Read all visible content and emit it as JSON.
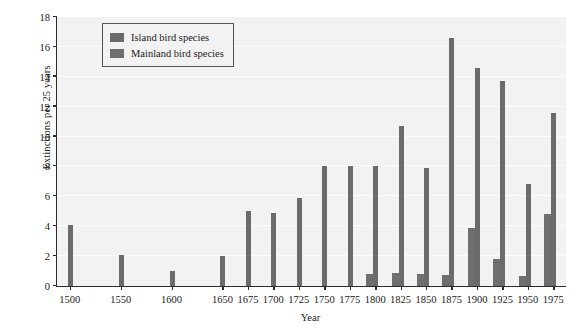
{
  "chart_data": {
    "type": "bar",
    "title": "",
    "xlabel": "Year",
    "ylabel": "Extinctions per 25 years",
    "xlim": [
      1487.5,
      1987.5
    ],
    "ylim": [
      0,
      18
    ],
    "ytick_step": 2,
    "grid": true,
    "legend_position": "top-left-inside",
    "categories": [
      1500,
      1525,
      1550,
      1575,
      1600,
      1625,
      1650,
      1675,
      1700,
      1725,
      1750,
      1775,
      1800,
      1825,
      1850,
      1875,
      1900,
      1925,
      1950,
      1975
    ],
    "xtick_labels": [
      "1500",
      "1550",
      "1600",
      "1650",
      "1675",
      "1700",
      "1725",
      "1750",
      "1775",
      "1800",
      "1825",
      "1850",
      "1875",
      "1900",
      "1925",
      "1950",
      "1975"
    ],
    "xtick_values": [
      1500,
      1550,
      1600,
      1650,
      1675,
      1700,
      1725,
      1750,
      1775,
      1800,
      1825,
      1850,
      1875,
      1900,
      1925,
      1950,
      1975
    ],
    "ytick_labels": [
      "0",
      "2",
      "4",
      "6",
      "8",
      "10",
      "12",
      "14",
      "16",
      "18"
    ],
    "ytick_values": [
      0,
      2,
      4,
      6,
      8,
      10,
      12,
      14,
      16,
      18
    ],
    "series": [
      {
        "name": "Island bird species",
        "color": "#6b6b6b",
        "values": [
          4.1,
          0,
          2.1,
          0,
          1.0,
          0,
          2.0,
          5.0,
          4.9,
          5.9,
          8.0,
          8.0,
          8.0,
          10.7,
          7.9,
          16.6,
          14.6,
          13.7,
          6.8,
          11.6
        ]
      },
      {
        "name": "Mainland bird species",
        "color": "#6f6f6f",
        "values": [
          0,
          0,
          0,
          0,
          0,
          0,
          0,
          0,
          0,
          0,
          0,
          0,
          0.8,
          0.85,
          0.8,
          0.75,
          3.9,
          1.8,
          0.7,
          4.8
        ]
      }
    ]
  },
  "legend": {
    "entries": [
      {
        "label": "Island bird species",
        "swatch_color": "#6b6b6b"
      },
      {
        "label": "Mainland bird species",
        "swatch_color": "#6f6f6f"
      }
    ]
  },
  "axes": {
    "x_title": "Year",
    "y_title": "Extinctions per 25 years"
  },
  "colors": {
    "plot_background": "#f2f2f2",
    "figure_background": "#ffffff",
    "axis_line": "#2b2b2b",
    "gridline": "#fcfcfc",
    "text": "#1a1a1a"
  }
}
